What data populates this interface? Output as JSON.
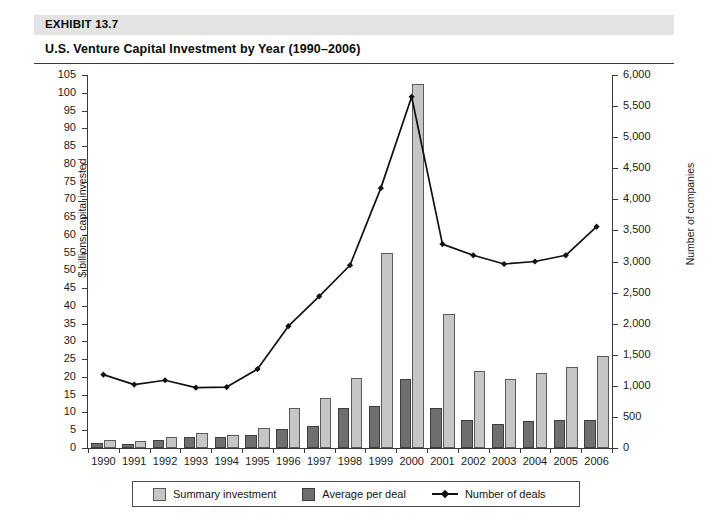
{
  "header": {
    "exhibit_label": "EXHIBIT 13.7",
    "title": "U.S. Venture Capital Investment by Year (1990–2006)"
  },
  "legend": {
    "summary_label": "Summary investment",
    "average_label": "Average per deal",
    "deals_label": "Number of deals"
  },
  "colors": {
    "summary_bar": "#c6c6c6",
    "average_bar": "#6f6f6f",
    "line": "#111111",
    "band": "#e3e3e3",
    "axis": "#3a3a3a"
  },
  "chart_data": {
    "type": "bar",
    "title": "U.S. Venture Capital Investment by Year (1990–2006)",
    "xlabel": "",
    "ylabel": "$ billions, capital invested",
    "y2label": "Number of companies",
    "ylim": [
      0,
      105
    ],
    "y2lim": [
      0,
      6000
    ],
    "grid": false,
    "legend_position": "bottom",
    "categories": [
      "1990",
      "1991",
      "1992",
      "1993",
      "1994",
      "1995",
      "1996",
      "1997",
      "1998",
      "1999",
      "2000",
      "2001",
      "2002",
      "2003",
      "2004",
      "2005",
      "2006"
    ],
    "left_ticks": [
      0,
      5,
      10,
      15,
      20,
      25,
      30,
      35,
      40,
      45,
      50,
      55,
      60,
      65,
      70,
      75,
      80,
      85,
      90,
      95,
      100,
      105
    ],
    "right_ticks": [
      "0",
      "500",
      "1,000",
      "1,500",
      "2,000",
      "2,500",
      "3,000",
      "3,500",
      "4,000",
      "4,500",
      "5,000",
      "5,500",
      "6,000"
    ],
    "right_tick_values": [
      0,
      500,
      1000,
      1500,
      2000,
      2500,
      3000,
      3500,
      4000,
      4500,
      5000,
      5500,
      6000
    ],
    "series": [
      {
        "name": "Summary investment",
        "type": "bar",
        "axis": "left",
        "unit": "$ billions",
        "color": "#c6c6c6",
        "values": [
          2.3,
          2.0,
          3.2,
          4.2,
          3.7,
          5.5,
          11.3,
          14.2,
          19.8,
          54.8,
          102.5,
          37.8,
          21.8,
          19.4,
          21.0,
          22.7,
          26.0
        ]
      },
      {
        "name": "Average per deal",
        "type": "bar",
        "axis": "left",
        "unit": "$ millions (plotted on left scale)",
        "color": "#6f6f6f",
        "values": [
          1.5,
          1.2,
          2.2,
          3.2,
          3.0,
          3.8,
          5.3,
          6.3,
          11.3,
          11.8,
          19.3,
          11.2,
          7.8,
          6.9,
          7.6,
          7.8,
          7.9
        ]
      },
      {
        "name": "Number of deals",
        "type": "line",
        "axis": "right",
        "unit": "companies",
        "color": "#111111",
        "values": [
          1180,
          1020,
          1090,
          970,
          980,
          1270,
          1960,
          2440,
          2940,
          4180,
          5650,
          3280,
          3100,
          2960,
          3000,
          3100,
          3560
        ]
      }
    ]
  }
}
